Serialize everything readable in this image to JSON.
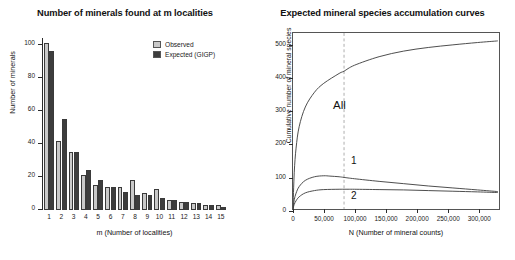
{
  "chart_data": [
    {
      "type": "bar",
      "title": "Number of minerals found at m localities",
      "xlabel": "m (Number of localities)",
      "ylabel": "Number of minerals",
      "categories": [
        "1",
        "2",
        "3",
        "4",
        "5",
        "6",
        "7",
        "8",
        "9",
        "10",
        "11",
        "12",
        "13",
        "14",
        "15"
      ],
      "ylim": [
        0,
        104
      ],
      "yticks": [
        0,
        20,
        40,
        60,
        80,
        100
      ],
      "grid": false,
      "legend_position": "top-right",
      "series": [
        {
          "name": "Observed",
          "color": "#c9c9c9",
          "values": [
            101,
            42,
            35,
            21,
            15,
            14,
            14,
            18,
            10,
            13,
            6,
            5,
            4,
            3,
            3
          ]
        },
        {
          "name": "Expected (GIGP)",
          "color": "#3d3d3d",
          "values": [
            96,
            55,
            35,
            24,
            18,
            14,
            11,
            9,
            9,
            7,
            6,
            5,
            4,
            3,
            2
          ]
        }
      ]
    },
    {
      "type": "line",
      "title": "Expected mineral species accumulation curves",
      "xlabel": "N (Number of mineral counts)",
      "ylabel": "Cumulative number of mineral species",
      "xlim": [
        0,
        335000
      ],
      "ylim": [
        0,
        535
      ],
      "xticks": [
        0,
        50000,
        100000,
        150000,
        200000,
        250000,
        300000
      ],
      "xtick_labels": [
        "0",
        "50,000",
        "100,000",
        "150,000",
        "200,000",
        "250,000",
        "300,000"
      ],
      "yticks": [
        0,
        100,
        200,
        300,
        400,
        500
      ],
      "grid": false,
      "annotations": [
        {
          "label": "All",
          "x": 40000,
          "y": 395
        },
        {
          "label": "1",
          "x": 55000,
          "y": 125
        },
        {
          "label": "2",
          "x": 55000,
          "y": 28
        }
      ],
      "reference_line": {
        "x": 83000,
        "style": "dashed",
        "color": "#9a9a9a"
      },
      "series": [
        {
          "name": "All",
          "color": "#3a3a3a",
          "x": [
            0,
            2000,
            5000,
            10000,
            20000,
            35000,
            50000,
            75000,
            83000,
            100000,
            140000,
            180000,
            220000,
            260000,
            300000,
            333000
          ],
          "y": [
            0,
            110,
            185,
            250,
            310,
            355,
            382,
            412,
            419,
            437,
            463,
            480,
            491,
            499,
            506,
            511
          ]
        },
        {
          "name": "1",
          "color": "#3a3a3a",
          "x": [
            0,
            2000,
            5000,
            10000,
            20000,
            35000,
            50000,
            60000,
            75000,
            83000,
            100000,
            140000,
            180000,
            220000,
            260000,
            300000,
            333000
          ],
          "y": [
            0,
            28,
            48,
            68,
            87,
            98,
            101,
            100,
            98,
            96,
            92,
            84,
            77,
            70,
            64,
            58,
            53
          ]
        },
        {
          "name": "2",
          "color": "#3a3a3a",
          "x": [
            0,
            2000,
            5000,
            10000,
            20000,
            35000,
            50000,
            75000,
            83000,
            100000,
            140000,
            180000,
            220000,
            260000,
            300000,
            333000
          ],
          "y": [
            0,
            14,
            25,
            37,
            49,
            56,
            59,
            60,
            60,
            60,
            59,
            58,
            56,
            54,
            52,
            50
          ]
        }
      ]
    }
  ],
  "left_chart": {
    "title": "Number of minerals found at m localities",
    "xlabel": "m (Number of localities)",
    "ylabel": "Number of minerals",
    "legend": {
      "observed_label": "Observed",
      "expected_label": "Expected (GIGP)"
    }
  },
  "right_chart": {
    "title": "Expected mineral species accumulation curves",
    "xlabel": "N (Number of mineral counts)",
    "ylabel": "Cumulative number of mineral species"
  }
}
